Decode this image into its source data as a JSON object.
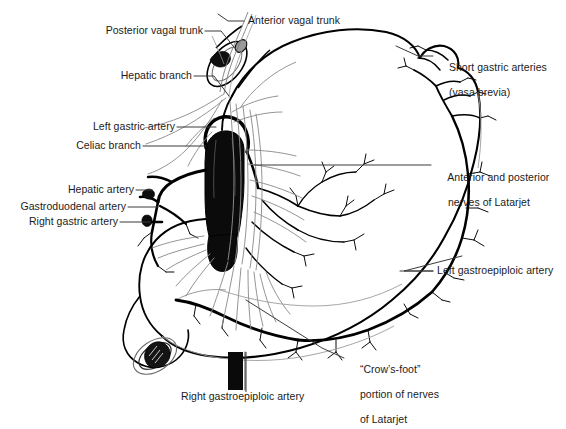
{
  "figure": {
    "background_color": "#ffffff",
    "ink_color": "#000000",
    "leader_line_color": "#3b3b3b"
  },
  "labels": {
    "posterior_vagal_trunk": "Posterior vagal trunk",
    "anterior_vagal_trunk": "Anterior vagal trunk",
    "short_gastric_arteries_line1": "Short gastric arteries",
    "short_gastric_arteries_line2": "(vasa brevia)",
    "hepatic_branch": "Hepatic branch",
    "left_gastric_artery": "Left gastric artery",
    "celiac_branch": "Celiac branch",
    "hepatic_artery": "Hepatic artery",
    "gastroduodenal_artery": "Gastroduodenal artery",
    "right_gastric_artery": "Right gastric artery",
    "nerves_of_latarjet_line1": "Anterior and posterior",
    "nerves_of_latarjet_line2": "nerves of Latarjet",
    "left_gastroepiploic_artery": "Left gastroepiploic artery",
    "crows_foot_line1": "“Crow’s-foot”",
    "crows_foot_line2": "portion of nerves",
    "crows_foot_line3": "of Latarjet",
    "right_gastroepiploic_artery": "Right gastroepiploic artery"
  }
}
